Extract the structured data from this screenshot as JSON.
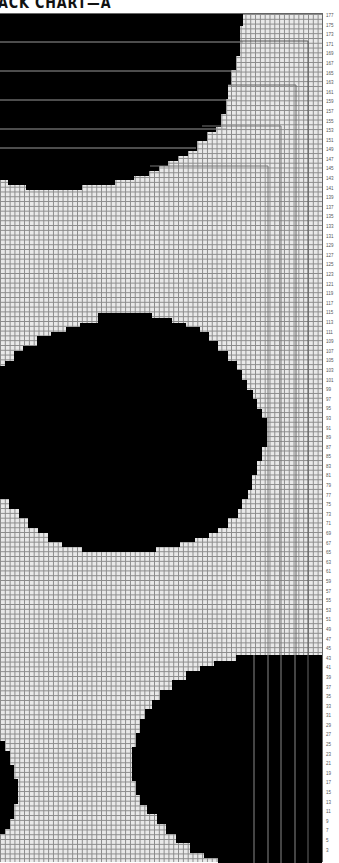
{
  "title": "ACK CHART—A",
  "chart_data": {
    "type": "knitting-colorwork-chart",
    "title": "ACK CHART—A",
    "rows": 177,
    "row_labels": [
      177,
      175,
      173,
      171,
      169,
      167,
      165,
      163,
      161,
      159,
      157,
      155,
      153,
      151,
      149,
      147,
      145,
      143,
      141,
      139,
      137,
      135,
      133,
      131,
      129,
      127,
      125,
      123,
      121,
      119,
      117,
      115,
      113,
      111,
      109,
      107,
      105,
      103,
      101,
      99,
      97,
      95,
      93,
      91,
      89,
      87,
      85,
      83,
      81,
      79,
      77,
      75,
      73,
      71,
      69,
      67,
      65,
      63,
      61,
      59,
      57,
      55,
      53,
      51,
      49,
      47,
      45,
      43,
      41,
      39,
      37,
      35,
      33,
      31,
      29,
      27,
      25,
      23,
      21,
      19,
      17,
      15,
      13,
      11,
      9,
      7,
      5,
      3
    ],
    "row_label_side": "right",
    "colors": {
      "background_cell": "#e9e9e9",
      "contrast_cell": "#000000",
      "grid_line": "#8a8a8a"
    },
    "motifs": [
      {
        "name": "top-half-circle",
        "rows": "140-177",
        "position": "top-left"
      },
      {
        "name": "middle-circle",
        "rows": "73-116",
        "position": "center-left"
      },
      {
        "name": "bottom-right-circle",
        "rows": "1-45",
        "position": "bottom-right"
      },
      {
        "name": "bottom-left-partial",
        "rows": "7-25",
        "position": "bottom-left-edge"
      }
    ],
    "grid": true
  }
}
